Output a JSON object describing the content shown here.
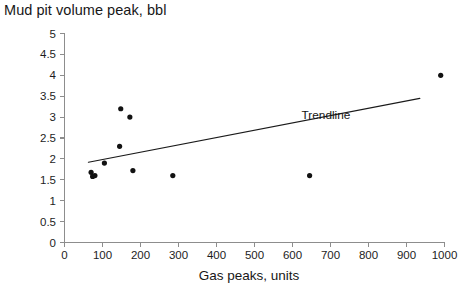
{
  "chart_data": {
    "type": "scatter",
    "title": "Mud pit volume peak, bbl",
    "subtitle": "",
    "xlabel": "Gas peaks, units",
    "ylabel": "Mud pit volume peak, bbl",
    "xlim": [
      0,
      1000
    ],
    "ylim": [
      0,
      5
    ],
    "xticks": [
      0,
      100,
      200,
      300,
      400,
      500,
      600,
      700,
      800,
      900,
      1000
    ],
    "xtick_labels": [
      "0",
      "100",
      "200",
      "300",
      "400",
      "500",
      "600",
      "700",
      "800",
      "900",
      "1000"
    ],
    "yticks": [
      0,
      0.5,
      1,
      1.5,
      2,
      2.5,
      3,
      3.5,
      4,
      4.5,
      5
    ],
    "ytick_labels": [
      "0",
      "0.5",
      "1",
      "1.5",
      "2",
      "2.5",
      "3",
      "3.5",
      "4",
      "4.5",
      "5"
    ],
    "grid": false,
    "legend": false,
    "legend_position": "none",
    "marker_color": "#121212",
    "marker_shape": "circle",
    "axis_color": "#8d8d8d",
    "background": "#ffffff",
    "points": [
      {
        "x": 70,
        "y": 1.68
      },
      {
        "x": 74,
        "y": 1.58
      },
      {
        "x": 80,
        "y": 1.6
      },
      {
        "x": 105,
        "y": 1.9
      },
      {
        "x": 148,
        "y": 3.2
      },
      {
        "x": 145,
        "y": 2.3
      },
      {
        "x": 172,
        "y": 3.0
      },
      {
        "x": 180,
        "y": 1.72
      },
      {
        "x": 285,
        "y": 1.6
      },
      {
        "x": 645,
        "y": 1.6
      },
      {
        "x": 990,
        "y": 4.0
      }
    ],
    "annotations": [
      {
        "text": "Trendline",
        "x": 688,
        "y": 2.95
      }
    ],
    "trendline": {
      "label": "Trendline",
      "x0": 63,
      "y0": 1.92,
      "x1": 935,
      "y1": 3.45,
      "slope": 0.00175,
      "intercept": 1.81
    }
  }
}
